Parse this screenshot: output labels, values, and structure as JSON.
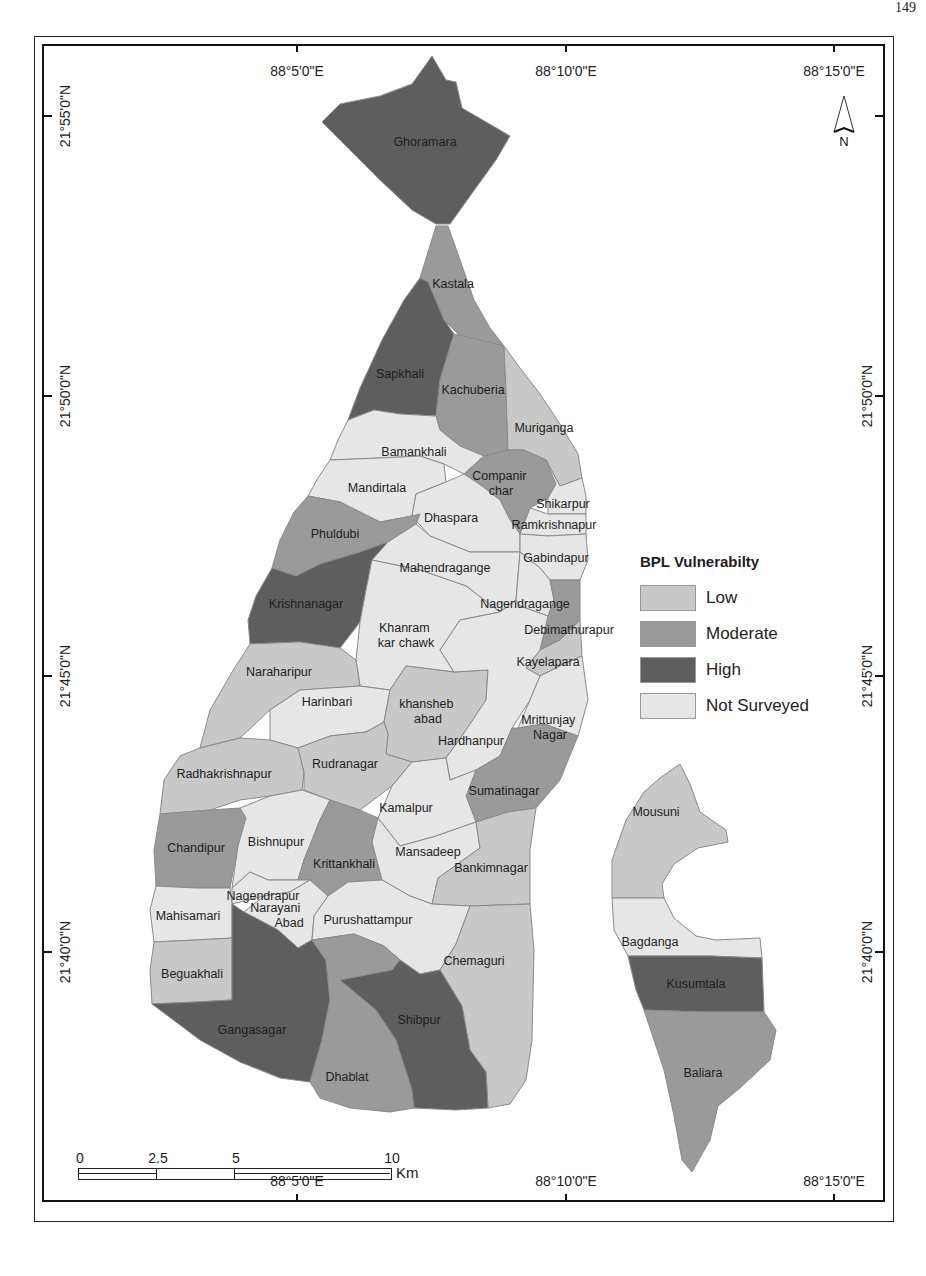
{
  "page": {
    "page_number": "149"
  },
  "map": {
    "legend": {
      "title": "BPL Vulnerabilty",
      "items": [
        {
          "label": "Low",
          "color": "#c8c8c8"
        },
        {
          "label": "Moderate",
          "color": "#9a9a9a"
        },
        {
          "label": "High",
          "color": "#5e5e5e"
        },
        {
          "label": "Not Surveyed",
          "color": "#e6e6e6"
        }
      ]
    },
    "graticule": {
      "top_longitudes": [
        "88°5'0\"E",
        "88°10'0\"E",
        "88°15'0\"E"
      ],
      "bottom_longitudes": [
        "88°5'0\"E",
        "88°10'0\"E",
        "88°15'0\"E"
      ],
      "left_latitudes": [
        "21°55'0\"N",
        "21°50'0\"N",
        "21°45'0\"N",
        "21°40'0\"N"
      ],
      "right_latitudes": [
        "21°50'0\"N",
        "21°45'0\"N",
        "21°40'0\"N"
      ]
    },
    "north_arrow": {
      "label": "N"
    },
    "scale_bar": {
      "ticks": [
        "0",
        "2.5",
        "5",
        "10"
      ],
      "unit": "Km"
    },
    "regions": [
      {
        "name": "Ghoramara",
        "class": "High"
      },
      {
        "name": "Kastala",
        "class": "Moderate"
      },
      {
        "name": "Sapkhali",
        "class": "High"
      },
      {
        "name": "Kachuberia",
        "class": "Moderate"
      },
      {
        "name": "Muriganga",
        "class": "Low"
      },
      {
        "name": "Bamankhali",
        "class": "Not Surveyed"
      },
      {
        "name": "Mandirtala",
        "class": "Not Surveyed"
      },
      {
        "name": "Companir char",
        "class": "Moderate"
      },
      {
        "name": "Shikarpur",
        "class": "Not Surveyed"
      },
      {
        "name": "Ramkrishnapur",
        "class": "Not Surveyed"
      },
      {
        "name": "Dhaspara",
        "class": "Not Surveyed"
      },
      {
        "name": "Phuldubi",
        "class": "Moderate"
      },
      {
        "name": "Gabindapur",
        "class": "Not Surveyed"
      },
      {
        "name": "Mahendragange",
        "class": "Not Surveyed"
      },
      {
        "name": "Krishnanagar",
        "class": "High"
      },
      {
        "name": "Nagendragange",
        "class": "Not Surveyed"
      },
      {
        "name": "Debimathurapur",
        "class": "Moderate"
      },
      {
        "name": "Khanram kar chawk",
        "class": "Not Surveyed"
      },
      {
        "name": "Kayelapara",
        "class": "Low"
      },
      {
        "name": "Naraharipur",
        "class": "Low"
      },
      {
        "name": "Harinbari",
        "class": "Not Surveyed"
      },
      {
        "name": "khansheb abad",
        "class": "Low"
      },
      {
        "name": "Hardhanpur",
        "class": "Not Surveyed"
      },
      {
        "name": "Mrittunjay Nagar",
        "class": "Not Surveyed"
      },
      {
        "name": "Radhakrishnapur",
        "class": "Low"
      },
      {
        "name": "Rudranagar",
        "class": "Low"
      },
      {
        "name": "Sumatinagar",
        "class": "Moderate"
      },
      {
        "name": "Kamalpur",
        "class": "Not Surveyed"
      },
      {
        "name": "Chandipur",
        "class": "Moderate"
      },
      {
        "name": "Bishnupur",
        "class": "Not Surveyed"
      },
      {
        "name": "Krittankhali",
        "class": "Moderate"
      },
      {
        "name": "Mansadeep",
        "class": "Not Surveyed"
      },
      {
        "name": "Bankimnagar",
        "class": "Low"
      },
      {
        "name": "Nagendrapur",
        "class": "Not Surveyed"
      },
      {
        "name": "Narayani Abad",
        "class": "Not Surveyed"
      },
      {
        "name": "Mahisamari",
        "class": "Not Surveyed"
      },
      {
        "name": "Purushattampur",
        "class": "Not Surveyed"
      },
      {
        "name": "Beguakhali",
        "class": "Low"
      },
      {
        "name": "Chemaguri",
        "class": "Low"
      },
      {
        "name": "Gangasagar",
        "class": "High"
      },
      {
        "name": "Shibpur",
        "class": "High"
      },
      {
        "name": "Dhablat",
        "class": "Moderate"
      },
      {
        "name": "Mousuni",
        "class": "Low"
      },
      {
        "name": "Bagdanga",
        "class": "Not Surveyed"
      },
      {
        "name": "Kusumtala",
        "class": "High"
      },
      {
        "name": "Baliara",
        "class": "Moderate"
      }
    ]
  }
}
